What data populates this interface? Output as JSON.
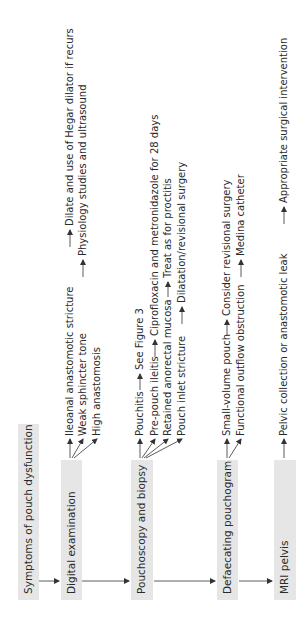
{
  "diagram": {
    "colors": {
      "box_fill": "#e6e6e6",
      "text": "#2a2a2a",
      "line": "#333333",
      "background": "#ffffff"
    },
    "start": {
      "label": "Symptoms of pouch dysfunction"
    },
    "steps": [
      {
        "label": "Digital examination",
        "findings": [
          {
            "finding": "Ileoanal anastomotic stricture",
            "action": "Dilate and use of Hegar dilator if recurs"
          },
          {
            "finding": "Weak sphincter tone",
            "action": "Physiology studies and ultrasound"
          },
          {
            "finding": "High anastomosis",
            "action": ""
          }
        ]
      },
      {
        "label": "Pouchoscopy and biopsy",
        "findings": [
          {
            "finding": "Pouchitis",
            "action": "See Figure 3"
          },
          {
            "finding": "Pre-pouch ileitis",
            "action": "Ciprofloxacin and metronidazole for 28 days"
          },
          {
            "finding": "Retained anorectal mucosa",
            "action": "Treat as for proctitis"
          },
          {
            "finding": "Pouch inlet stricture",
            "action": "Dilatation/revisional surgery"
          }
        ]
      },
      {
        "label": "Defaecating pouchogram",
        "findings": [
          {
            "finding": "Small-volume pouch",
            "action": "Consider revisional surgery"
          },
          {
            "finding": "Functional outflow obstruction",
            "action": "Medina catheter"
          }
        ]
      },
      {
        "label": "MRI pelvis",
        "findings": [
          {
            "finding": "Pelvic collection or anastomotic leak",
            "action": "Appropriate surgical intervention"
          }
        ]
      }
    ]
  }
}
